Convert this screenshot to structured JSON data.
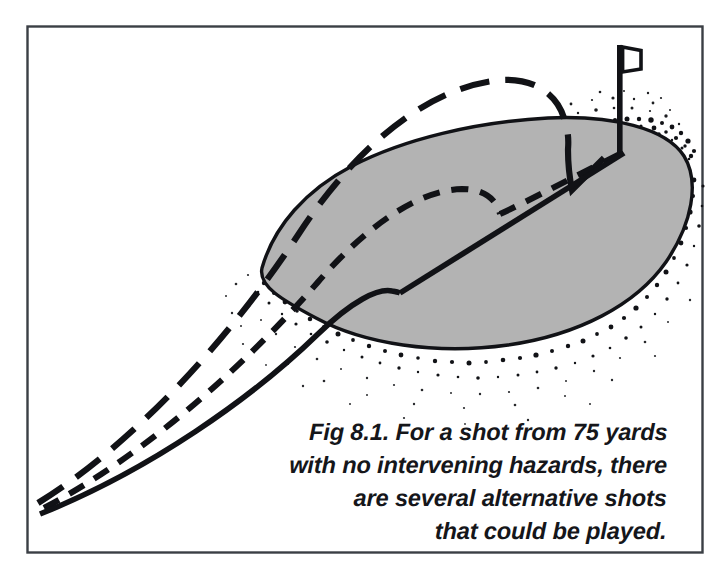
{
  "figure": {
    "id": "fig-8-1",
    "kind": "golf-shot-trajectory-illustration",
    "background_color": "#ffffff",
    "border_color": "#3b3f45",
    "frame": {
      "x": 27,
      "y": 26,
      "width": 676,
      "height": 527
    },
    "caption": {
      "align": "right",
      "color": "#15161a",
      "lines": [
        "Fig 8.1. For a shot from 75 yards",
        "with no intervening hazards, there",
        "are several alternative shots",
        "that could be played."
      ],
      "full_text": "Fig 8.1. For a shot from 75 yards with no intervening hazards, there are several alternative shots that could be played."
    },
    "green": {
      "label": "putting-green",
      "fill_color": "#b3b3b3",
      "outline_color": "#111216",
      "rough_fringe_color": "#111216"
    },
    "flag": {
      "label": "pin-flag",
      "color": "#111216",
      "pole_top_y": 45,
      "pole_base_y": 153,
      "pole_x": 620
    },
    "trajectories": [
      {
        "name": "chip-and-run",
        "style": "solid",
        "description": "low running chip that lands short and releases to the hole"
      },
      {
        "name": "pitch-shot",
        "style": "short-dashed",
        "description": "medium pitch that lands on the green and rolls to the hole"
      },
      {
        "name": "lob-shot",
        "style": "long-dashed",
        "description": "high lofted shot that drops steeply beside the flag"
      }
    ]
  }
}
